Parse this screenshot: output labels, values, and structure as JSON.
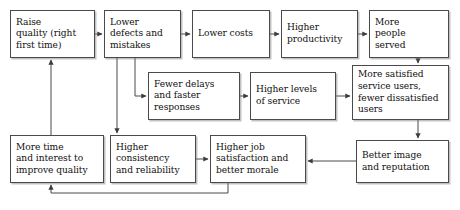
{
  "diagram": {
    "style": {
      "line_color": "#4a4a4a",
      "box_border_color": "#4a4a4a",
      "box_fill": "#ffffff",
      "text_color": "#100f0f",
      "page_background": "#ffffff"
    },
    "nodes": [
      {
        "id": "raise-quality",
        "label": "Raise\nquality (right\nfirst time)",
        "x": 10,
        "y": 10,
        "w": 85,
        "h": 48
      },
      {
        "id": "lower-defects",
        "label": "Lower\ndefects and\nmistakes",
        "x": 104,
        "y": 10,
        "w": 77,
        "h": 48
      },
      {
        "id": "lower-costs",
        "label": "Lower costs",
        "x": 192,
        "y": 10,
        "w": 78,
        "h": 48
      },
      {
        "id": "higher-productivity",
        "label": "Higher\nproductivity",
        "x": 281,
        "y": 10,
        "w": 77,
        "h": 48
      },
      {
        "id": "more-people-served",
        "label": "More\npeople\nserved",
        "x": 369,
        "y": 10,
        "w": 80,
        "h": 48
      },
      {
        "id": "fewer-delays",
        "label": "Fewer delays\nand faster\nresponses",
        "x": 148,
        "y": 72,
        "w": 92,
        "h": 48
      },
      {
        "id": "higher-levels-service",
        "label": "Higher levels\nof service",
        "x": 250,
        "y": 72,
        "w": 86,
        "h": 48
      },
      {
        "id": "more-satisfied-users",
        "label": "More satisfied\nservice users,\nfewer dissatisfied\nusers",
        "x": 352,
        "y": 65,
        "w": 97,
        "h": 55
      },
      {
        "id": "more-time-interest",
        "label": "More time\nand interest to\nimprove quality",
        "x": 10,
        "y": 135,
        "w": 94,
        "h": 48
      },
      {
        "id": "higher-consistency",
        "label": "Higher\nconsistency\nand reliability",
        "x": 110,
        "y": 135,
        "w": 86,
        "h": 48
      },
      {
        "id": "higher-job-satisfaction",
        "label": "Higher job\nsatisfaction and\nbetter morale",
        "x": 210,
        "y": 135,
        "w": 96,
        "h": 48
      },
      {
        "id": "better-image",
        "label": "Better image\nand reputation",
        "x": 356,
        "y": 140,
        "w": 93,
        "h": 43
      }
    ],
    "edges": [
      {
        "id": "raise-to-defects",
        "from": "raise-quality",
        "to": "lower-defects",
        "kind": "horizontal-right"
      },
      {
        "id": "defects-to-costs",
        "from": "lower-defects",
        "to": "lower-costs",
        "kind": "horizontal-right"
      },
      {
        "id": "costs-to-productivity",
        "from": "lower-costs",
        "to": "higher-productivity",
        "kind": "horizontal-right"
      },
      {
        "id": "productivity-to-people",
        "from": "higher-productivity",
        "to": "more-people-served",
        "kind": "horizontal-right"
      },
      {
        "id": "defects-to-delays",
        "from": "lower-defects",
        "to": "fewer-delays",
        "kind": "elbow-down-right"
      },
      {
        "id": "defects-to-consistency",
        "from": "lower-defects",
        "to": "higher-consistency",
        "kind": "vertical-down"
      },
      {
        "id": "delays-to-service",
        "from": "fewer-delays",
        "to": "higher-levels-service",
        "kind": "horizontal-right"
      },
      {
        "id": "service-to-satisfied",
        "from": "higher-levels-service",
        "to": "more-satisfied-users",
        "kind": "horizontal-right"
      },
      {
        "id": "people-to-satisfied",
        "from": "more-people-served",
        "to": "more-satisfied-users",
        "kind": "vertical-down"
      },
      {
        "id": "satisfied-to-image",
        "from": "more-satisfied-users",
        "to": "better-image",
        "kind": "vertical-down"
      },
      {
        "id": "image-to-jobsat",
        "from": "better-image",
        "to": "higher-job-satisfaction",
        "kind": "horizontal-left"
      },
      {
        "id": "consistency-to-jobsat",
        "from": "higher-consistency",
        "to": "higher-job-satisfaction",
        "kind": "horizontal-right"
      },
      {
        "id": "jobsat-to-moretime",
        "from": "higher-job-satisfaction",
        "to": "more-time-interest",
        "kind": "elbow-down-left-up"
      },
      {
        "id": "moretime-to-raise",
        "from": "more-time-interest",
        "to": "raise-quality",
        "kind": "vertical-up"
      }
    ]
  }
}
